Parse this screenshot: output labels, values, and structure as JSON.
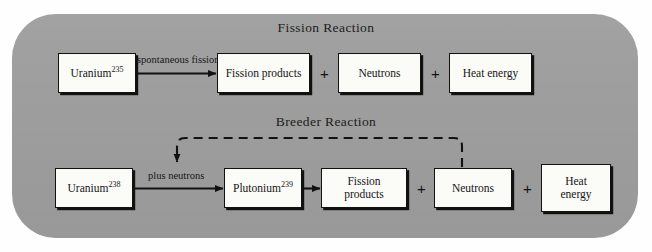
{
  "diagram": {
    "title_fission": "Fission Reaction",
    "title_breeder": "Breeder Reaction",
    "panel_color": "#9e9e9e",
    "box_fill": "#fbfbf8",
    "line_color": "#121212"
  },
  "fission": {
    "reactant": {
      "name": "Uranium",
      "mass_number": "235"
    },
    "arrow_label": "spontaneous fission",
    "products": [
      {
        "label": "Fission products"
      },
      {
        "label": "Neutrons"
      },
      {
        "label": "Heat energy"
      }
    ],
    "operator": "+"
  },
  "breeder": {
    "reactant": {
      "name": "Uranium",
      "mass_number": "238"
    },
    "arrow_label": "plus neutrons",
    "intermediate": {
      "name": "Plutonium",
      "mass_number": "239"
    },
    "products": [
      {
        "label": "Fission products"
      },
      {
        "label": "Neutrons"
      },
      {
        "label_line1": "Heat",
        "label_line2": "energy"
      }
    ],
    "operator": "+",
    "feedback_note": "neutrons recycled"
  }
}
